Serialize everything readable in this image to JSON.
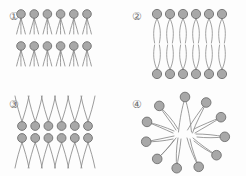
{
  "figure": {
    "background_color": "#fdfdfd",
    "width": 246,
    "height": 176,
    "head_fill": "#a8a8a8",
    "head_stroke": "#6f6f6f",
    "tail_stroke": "#8a8a8a",
    "label_color": "#6d6d6d"
  },
  "panels": [
    {
      "id": "panel-1",
      "label": "①",
      "label_number": "1",
      "arrangement": "two-stacked-monolayers-heads-up-tails-down",
      "rows": 2,
      "molecules_per_row": 6,
      "tails_per_molecule": 2,
      "head_radius": 4.3,
      "row_head_y": [
        14,
        46
      ],
      "tail_length": 16,
      "x_start": 21,
      "x_step": 13.2
    },
    {
      "id": "panel-2",
      "label": "②",
      "label_number": "2",
      "arrangement": "bilayer-heads-out-tails-interdigitated",
      "rows": 2,
      "molecules_per_row": 6,
      "tails_per_molecule": 2,
      "head_radius": 4.6,
      "row_head_y": [
        14,
        74
      ],
      "tail_length": 46,
      "x_start": 24,
      "x_step": 13.0
    },
    {
      "id": "panel-3",
      "label": "③",
      "label_number": "3",
      "arrangement": "inverted-bilayer-heads-in-middle-tails-out",
      "rows": 2,
      "molecules_per_row": 6,
      "tails_per_molecule": 2,
      "head_radius": 4.4,
      "row_head_y": [
        38,
        50
      ],
      "tail_length": 30,
      "x_start": 22,
      "x_step": 13.2
    },
    {
      "id": "panel-4",
      "label": "④",
      "label_number": "4",
      "arrangement": "micelle-radial-heads-out-tails-in",
      "head_count": 11,
      "tails_per_molecule": 2,
      "head_radius": 4.8,
      "center_x": 62,
      "center_y": 45,
      "head_ring_radius_x": 40,
      "head_ring_radius_y": 36,
      "core_radius": 13,
      "head_angles_deg": [
        -90,
        -58,
        -26,
        6,
        38,
        70,
        102,
        134,
        166,
        198,
        230
      ]
    }
  ]
}
